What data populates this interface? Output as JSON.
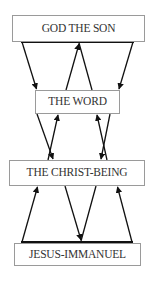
{
  "diagram": {
    "type": "hierarchy-flow",
    "colors": {
      "line": "#111111",
      "box_border": "#9a9a9a",
      "text": "#333333",
      "background": "#ffffff"
    },
    "nodes": [
      {
        "id": "god-the-son",
        "label": "GOD THE SON"
      },
      {
        "id": "the-word",
        "label": "THE WORD"
      },
      {
        "id": "the-christ-being",
        "label": "THE CHRIST-BEING"
      },
      {
        "id": "jesus-immanuel",
        "label": "JESUS-IMMANUEL"
      }
    ],
    "edges": [
      {
        "from": "god-the-son",
        "to": "the-word",
        "direction": "down",
        "position": "left"
      },
      {
        "from": "god-the-son",
        "to": "the-word",
        "direction": "down",
        "position": "right"
      },
      {
        "from": "the-word",
        "to": "god-the-son",
        "direction": "up",
        "position": "center-inverted-v"
      },
      {
        "from": "the-word",
        "to": "the-christ-being",
        "direction": "down",
        "position": "left-cross"
      },
      {
        "from": "the-christ-being",
        "to": "the-word",
        "direction": "up",
        "position": "left-cross"
      },
      {
        "from": "the-word",
        "to": "the-christ-being",
        "direction": "down",
        "position": "right-cross"
      },
      {
        "from": "the-christ-being",
        "to": "the-word",
        "direction": "up",
        "position": "right-cross"
      },
      {
        "from": "jesus-immanuel",
        "to": "the-christ-being",
        "direction": "up",
        "position": "left"
      },
      {
        "from": "jesus-immanuel",
        "to": "the-christ-being",
        "direction": "up",
        "position": "right"
      },
      {
        "from": "the-christ-being",
        "to": "jesus-immanuel",
        "direction": "down",
        "position": "center-v"
      }
    ]
  }
}
